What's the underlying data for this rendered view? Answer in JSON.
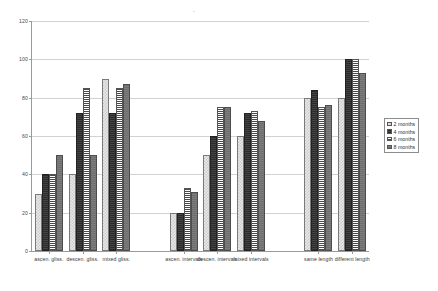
{
  "chart_data": {
    "type": "bar",
    "title": "",
    "xlabel": "",
    "ylabel": "",
    "ylim": [
      0,
      120
    ],
    "yticks": [
      0,
      20,
      40,
      60,
      80,
      100,
      120
    ],
    "grid": true,
    "legend_position": "right",
    "categories": [
      "ascen. gliss.",
      "descen. gliss.",
      "mixed gliss.",
      "ascen. intervals",
      "descen. intervals",
      "mixed intervals",
      "same length",
      "different length"
    ],
    "series": [
      {
        "name": "2 months",
        "values": [
          30,
          40,
          90,
          20,
          50,
          60,
          80,
          80
        ]
      },
      {
        "name": "4 months",
        "values": [
          40,
          72,
          72,
          20,
          60,
          72,
          84,
          100
        ]
      },
      {
        "name": "6 months",
        "values": [
          40,
          85,
          85,
          33,
          75,
          73,
          75,
          100
        ]
      },
      {
        "name": "8 months",
        "values": [
          50,
          50,
          87,
          31,
          75,
          68,
          76,
          93
        ]
      }
    ]
  },
  "legend": {
    "items": [
      {
        "label": "2 months"
      },
      {
        "label": "4 months"
      },
      {
        "label": "6 months"
      },
      {
        "label": "8 months"
      }
    ]
  },
  "group_breaks": [
    3,
    6
  ]
}
